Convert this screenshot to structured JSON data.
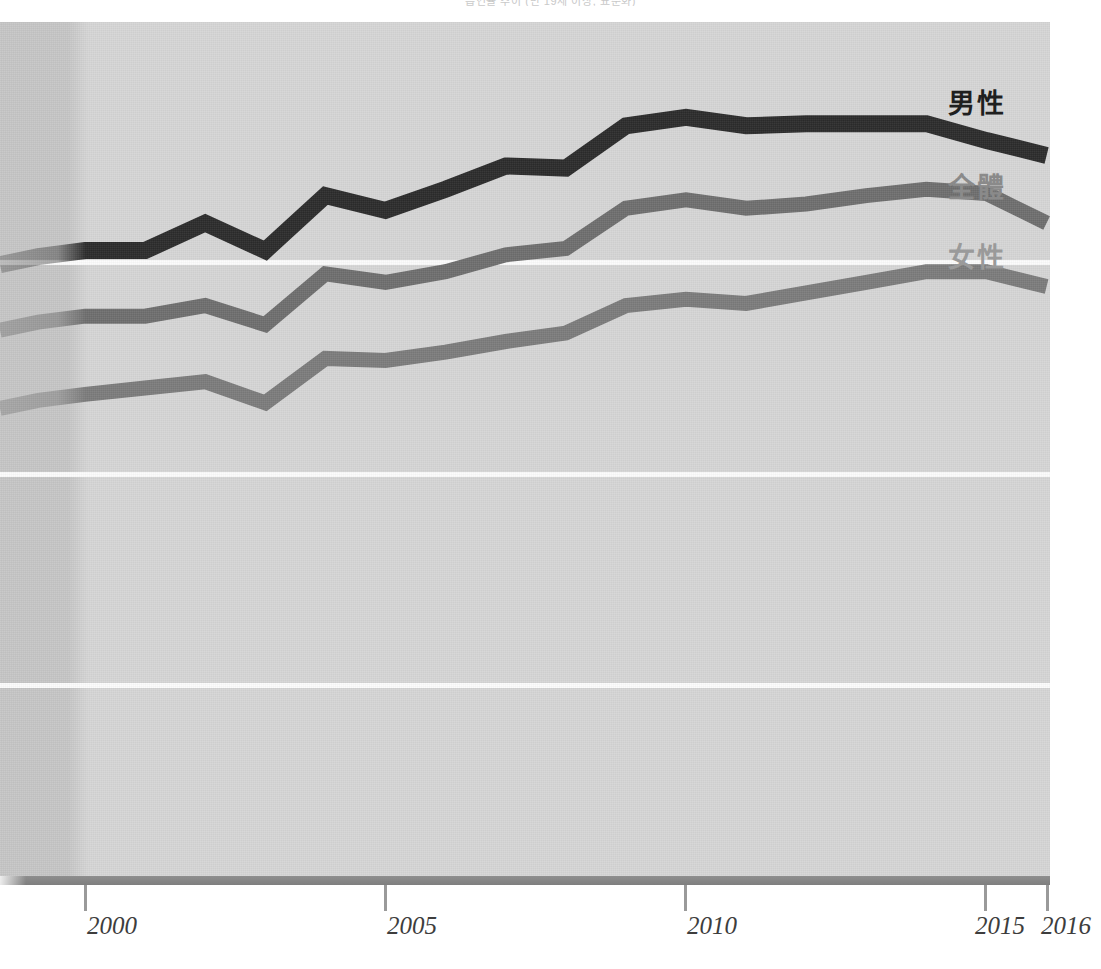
{
  "title": "흡연율 추이 (만 19세 이상, 표준화)",
  "chart_data": {
    "type": "line",
    "title": "흡연율 추이 (만 19세 이상, 표준화)",
    "xlabel": "",
    "ylabel": "",
    "grid": true,
    "gridlines_y": [
      3,
      2,
      1
    ],
    "legend_position": "inline-right",
    "x": [
      2000,
      2001,
      2002,
      2003,
      2004,
      2005,
      2006,
      2007,
      2008,
      2009,
      2010,
      2011,
      2012,
      2013,
      2014,
      2015,
      2016
    ],
    "xlim": [
      2000,
      2016
    ],
    "xticks": [
      2000,
      2005,
      2010,
      2015,
      2016
    ],
    "xtick_labels": [
      "2000",
      "2005",
      "2010",
      "2015",
      "2016"
    ],
    "ylim": [
      0,
      4.05
    ],
    "series": [
      {
        "name": "男性",
        "label": "男性",
        "color": "#2b2b2b",
        "values": [
          2.95,
          2.95,
          3.08,
          2.95,
          3.21,
          3.14,
          3.24,
          3.35,
          3.34,
          3.54,
          3.58,
          3.54,
          3.55,
          3.55,
          3.55,
          3.47,
          3.4
        ]
      },
      {
        "name": "全體",
        "label": "全體",
        "color": "#6e6e6e",
        "values": [
          2.64,
          2.64,
          2.69,
          2.6,
          2.84,
          2.8,
          2.85,
          2.93,
          2.96,
          3.15,
          3.19,
          3.15,
          3.17,
          3.21,
          3.24,
          3.22,
          3.08
        ]
      },
      {
        "name": "女性",
        "label": "女性",
        "color": "#7b7b7b",
        "values": [
          2.27,
          2.3,
          2.33,
          2.23,
          2.44,
          2.43,
          2.47,
          2.52,
          2.56,
          2.69,
          2.72,
          2.7,
          2.75,
          2.8,
          2.85,
          2.85,
          2.78
        ]
      }
    ],
    "colors": {
      "male": "#2b2b2b",
      "total": "#6e6e6e",
      "female": "#7b7b7b",
      "plot_background": "#d6d6d6",
      "pre_band": "#c6c6c6",
      "gridline": "#fcfcfc",
      "axis": "#8e8e8e",
      "tick": "#9a9a9a",
      "xlabel": "#3d3d3d"
    }
  },
  "legend": [
    {
      "label": "男性",
      "color": "#2b2b2b"
    },
    {
      "label": "全體",
      "color": "#6e6e6e"
    },
    {
      "label": "女性",
      "color": "#7b7b7b"
    }
  ],
  "axis": {
    "ticks": [
      {
        "label": "2000",
        "value": 2000
      },
      {
        "label": "2005",
        "value": 2005
      },
      {
        "label": "2010",
        "value": 2010
      },
      {
        "label": "2015",
        "value": 2015
      },
      {
        "label": "2016",
        "value": 2016
      }
    ]
  }
}
